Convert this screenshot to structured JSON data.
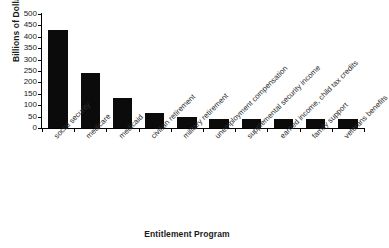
{
  "chart_data": {
    "type": "bar",
    "title": "",
    "xlabel": "Entitlement Program",
    "ylabel": "Billions of Dollars",
    "ylim": [
      0,
      500
    ],
    "yticks": [
      0,
      50,
      100,
      150,
      200,
      250,
      300,
      350,
      400,
      450,
      500
    ],
    "grid": false,
    "legend": null,
    "bar_color": "#0b0b0b",
    "axis_color": "#000000",
    "categories": [
      "social security",
      "medicare",
      "medicaid",
      "civilian retirement",
      "military retirement",
      "unemployment compensation",
      "supplemental security income",
      "earned income, child tax credits",
      "family support",
      "veterans benefits"
    ],
    "values": [
      430,
      240,
      130,
      65,
      48,
      40,
      40,
      40,
      40,
      40
    ]
  }
}
